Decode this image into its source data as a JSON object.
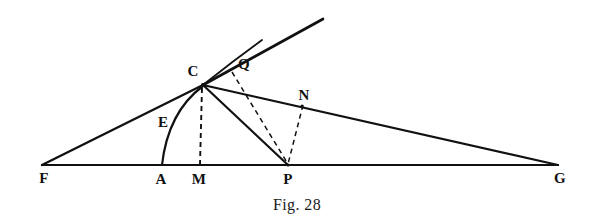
{
  "figure": {
    "caption": "Fig. 28",
    "caption_position": {
      "x": 295,
      "y": 205
    },
    "background_color": "#ffffff",
    "ink_color": "#111111",
    "canvas": {
      "width": 594,
      "height": 224
    },
    "points": [
      {
        "id": "F",
        "label": "F",
        "x": 42,
        "y": 165,
        "label_x": 44,
        "label_y": 178
      },
      {
        "id": "A",
        "label": "A",
        "x": 162,
        "y": 165,
        "label_x": 161,
        "label_y": 179
      },
      {
        "id": "M",
        "label": "M",
        "x": 200,
        "y": 165,
        "label_x": 199,
        "label_y": 179
      },
      {
        "id": "P",
        "label": "P",
        "x": 288,
        "y": 165,
        "label_x": 288,
        "label_y": 179
      },
      {
        "id": "G",
        "label": "G",
        "x": 558,
        "y": 165,
        "label_x": 560,
        "label_y": 178
      },
      {
        "id": "C",
        "label": "C",
        "x": 203,
        "y": 85,
        "label_x": 193,
        "label_y": 71
      },
      {
        "id": "E",
        "label": "E",
        "x": 176,
        "y": 122,
        "label_x": 163,
        "label_y": 122
      },
      {
        "id": "Q",
        "label": "Q",
        "x": 234,
        "y": 73,
        "label_x": 244,
        "label_y": 64
      },
      {
        "id": "N",
        "label": "N",
        "x": 302,
        "y": 106,
        "label_x": 304,
        "label_y": 95
      }
    ],
    "segments": [
      {
        "name": "baseline-FG",
        "from": "F",
        "to": "G",
        "style": "solid",
        "weight": 2.0
      },
      {
        "name": "line-FC",
        "from": "F",
        "to": "C",
        "style": "solid",
        "weight": 2.4
      },
      {
        "name": "line-CG",
        "from": "C",
        "to": "G",
        "style": "solid",
        "weight": 2.2
      },
      {
        "name": "line-CP",
        "from": "C",
        "to": "P",
        "style": "solid",
        "weight": 2.2
      },
      {
        "name": "line-CM",
        "from": "C",
        "to": "M",
        "style": "dashed",
        "weight": 1.8
      },
      {
        "name": "line-QP",
        "from": "Q",
        "to": "P",
        "style": "dashed",
        "weight": 1.6
      },
      {
        "name": "line-NP",
        "from": "N",
        "to": "P",
        "style": "dashed",
        "weight": 1.6
      }
    ],
    "rays": [
      {
        "name": "ray-tangent-upper",
        "from": "C",
        "to_x": 323,
        "to_y": 19,
        "style": "solid",
        "weight": 2.6
      },
      {
        "name": "ray-curve-upper",
        "from": "C",
        "to_x": 262,
        "to_y": 40,
        "style": "solid",
        "weight": 1.8
      }
    ],
    "arcs": [
      {
        "name": "arc-ACE",
        "from": "A",
        "to": "C",
        "through_label": "E",
        "control_x": 168,
        "control_y": 114,
        "style": "solid",
        "weight": 2.2
      }
    ]
  }
}
